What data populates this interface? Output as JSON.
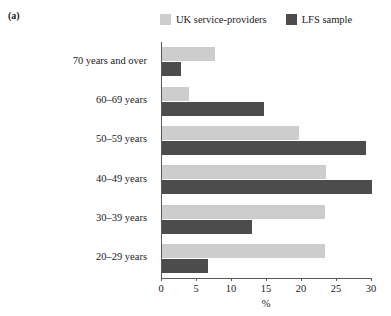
{
  "panel": {
    "label": "(a)"
  },
  "legend": {
    "position": "top",
    "items": [
      {
        "label": "UK service-providers",
        "color": "#cdcdcd",
        "swatch_name": "legend-swatch-uk-service-providers"
      },
      {
        "label": "LFS sample",
        "color": "#4c4c4c",
        "swatch_name": "legend-swatch-lfs-sample"
      }
    ]
  },
  "chart_data": {
    "type": "bar",
    "orientation": "horizontal",
    "title": "",
    "subtitle": "",
    "xlabel": "%",
    "ylabel": "",
    "xlim": [
      0,
      30
    ],
    "xticks": [
      0,
      5,
      10,
      15,
      20,
      25,
      30
    ],
    "xtick_labels": [
      "0",
      "5",
      "10",
      "15",
      "20",
      "25",
      "30"
    ],
    "grid": false,
    "legend_position": "top",
    "categories": [
      "70 years and over",
      "60–69 years",
      "50–59 years",
      "40–49 years",
      "30–39 years",
      "20–29 years"
    ],
    "series": [
      {
        "name": "UK service-providers",
        "color": "#cdcdcd",
        "values": [
          7.6,
          3.8,
          19.5,
          23.4,
          23.3,
          23.3
        ]
      },
      {
        "name": "LFS sample",
        "color": "#4c4c4c",
        "values": [
          2.7,
          14.6,
          29.1,
          30.0,
          12.8,
          6.6
        ]
      }
    ]
  }
}
